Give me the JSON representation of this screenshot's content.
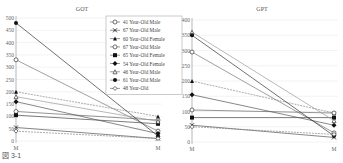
{
  "caption": "図 3-1",
  "chart_data": [
    {
      "type": "line",
      "title": "GOT",
      "categories": [
        "M",
        "M"
      ],
      "ylim": [
        0,
        500
      ],
      "yticks": [
        0,
        50,
        100,
        150,
        200,
        250,
        300,
        350,
        400,
        450,
        500
      ],
      "grid": true,
      "legend_position": "upper right",
      "series": [
        {
          "name": "41 Year-Old Male",
          "marker": "open-circle",
          "values": [
            330,
            40
          ]
        },
        {
          "name": "67 Year-Old Male",
          "marker": "x",
          "values": [
            55,
            10
          ]
        },
        {
          "name": "60 Year-Old Female",
          "marker": "triangle",
          "values": [
            200,
            100
          ]
        },
        {
          "name": "67 Year-Old Male",
          "marker": "open-circle",
          "values": [
            120,
            85
          ]
        },
        {
          "name": "65 Year-Old Female",
          "marker": "filled-square",
          "values": [
            105,
            70
          ]
        },
        {
          "name": "54 Year-Old Female",
          "marker": "filled-diamond",
          "values": [
            160,
            30
          ]
        },
        {
          "name": "46 Year-Old Male",
          "marker": "open-triangle",
          "values": [
            180,
            80
          ]
        },
        {
          "name": "61 Year-Old Male",
          "marker": "filled-circle",
          "values": [
            480,
            20
          ]
        },
        {
          "name": "48 Year-Old",
          "marker": "open-diamond",
          "values": [
            40,
            10
          ]
        }
      ]
    },
    {
      "type": "line",
      "title": "GPT",
      "categories": [
        "M",
        "M"
      ],
      "ylim": [
        0,
        400
      ],
      "yticks": [
        0,
        50,
        100,
        150,
        200,
        250,
        300,
        350,
        400
      ],
      "grid": true,
      "series": [
        {
          "name": "41 Year-Old Male",
          "marker": "open-circle",
          "values": [
            295,
            30
          ]
        },
        {
          "name": "67 Year-Old Male",
          "marker": "x",
          "values": [
            55,
            15
          ]
        },
        {
          "name": "60 Year-Old Female",
          "marker": "triangle",
          "values": [
            200,
            95
          ]
        },
        {
          "name": "67 Year-Old Male",
          "marker": "open-circle",
          "values": [
            105,
            95
          ]
        },
        {
          "name": "65 Year-Old Female",
          "marker": "filled-square",
          "values": [
            80,
            80
          ]
        },
        {
          "name": "54 Year-Old Female",
          "marker": "filled-diamond",
          "values": [
            155,
            55
          ]
        },
        {
          "name": "46 Year-Old Male",
          "marker": "open-triangle",
          "values": [
            360,
            70
          ]
        },
        {
          "name": "61 Year-Old Male",
          "marker": "filled-circle",
          "values": [
            350,
            20
          ]
        },
        {
          "name": "48 Year-Old",
          "marker": "open-diamond",
          "values": [
            50,
            25
          ]
        }
      ]
    }
  ]
}
